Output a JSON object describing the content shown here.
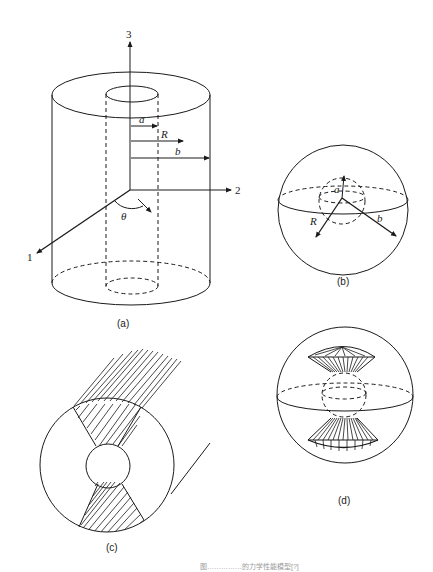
{
  "figure": {
    "panels": [
      {
        "id": "a",
        "label": "(a)",
        "description": "Hollow cylinder with inner radius a and outer radius b, cylindrical coordinates",
        "axis_labels": {
          "axis1": "1",
          "axis2": "2",
          "axis3": "3"
        },
        "dimension_labels": {
          "inner_radius": "a",
          "radius": "R",
          "outer_radius": "b",
          "angle": "θ"
        }
      },
      {
        "id": "b",
        "label": "(b)",
        "description": "Hollow sphere with inner radius a and outer radius b",
        "dimension_labels": {
          "inner_radius": "a",
          "radius": "R",
          "outer_radius": "b"
        }
      },
      {
        "id": "c",
        "label": "(c)",
        "description": "Cross-section of hollow cylinder with hatched regions extending as fibers"
      },
      {
        "id": "d",
        "label": "(d)",
        "description": "Hollow sphere with conical fiber bundles at the poles"
      }
    ],
    "caption": "图……………的力学性能模型[?]"
  },
  "colors": {
    "ink": "#1a1a1a",
    "background": "#ffffff",
    "caption_faint": "#9a9a9a"
  }
}
